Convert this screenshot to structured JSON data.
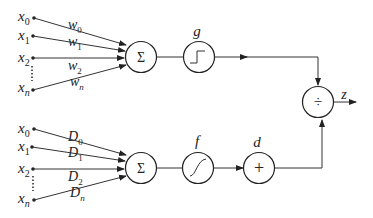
{
  "diagram": {
    "top_branch": {
      "inputs": [
        "x0",
        "x1",
        "x2",
        "xn"
      ],
      "input_labels": [
        {
          "base": "x",
          "sub": "0"
        },
        {
          "base": "x",
          "sub": "1"
        },
        {
          "base": "x",
          "sub": "2"
        },
        {
          "base": "x",
          "sub": "n"
        }
      ],
      "weights": [
        {
          "base": "w",
          "sub": "0"
        },
        {
          "base": "w",
          "sub": "1"
        },
        {
          "base": "w",
          "sub": "2"
        },
        {
          "base": "w",
          "sub": "n"
        }
      ],
      "sum_symbol": "Σ",
      "activation_label": "g",
      "activation_type": "step"
    },
    "bottom_branch": {
      "input_labels": [
        {
          "base": "x",
          "sub": "0"
        },
        {
          "base": "x",
          "sub": "1"
        },
        {
          "base": "x",
          "sub": "2"
        },
        {
          "base": "x",
          "sub": "n"
        }
      ],
      "weights": [
        {
          "base": "D",
          "sub": "0"
        },
        {
          "base": "D",
          "sub": "1"
        },
        {
          "base": "D",
          "sub": "2"
        },
        {
          "base": "D",
          "sub": "n"
        }
      ],
      "sum_symbol": "Σ",
      "activation_label": "f",
      "activation_type": "sigmoid",
      "bias_label": "d",
      "bias_symbol": "+"
    },
    "output": {
      "operator_symbol": "÷",
      "label": "z"
    },
    "colors": {
      "line": "#333333",
      "background": "#ffffff"
    }
  }
}
